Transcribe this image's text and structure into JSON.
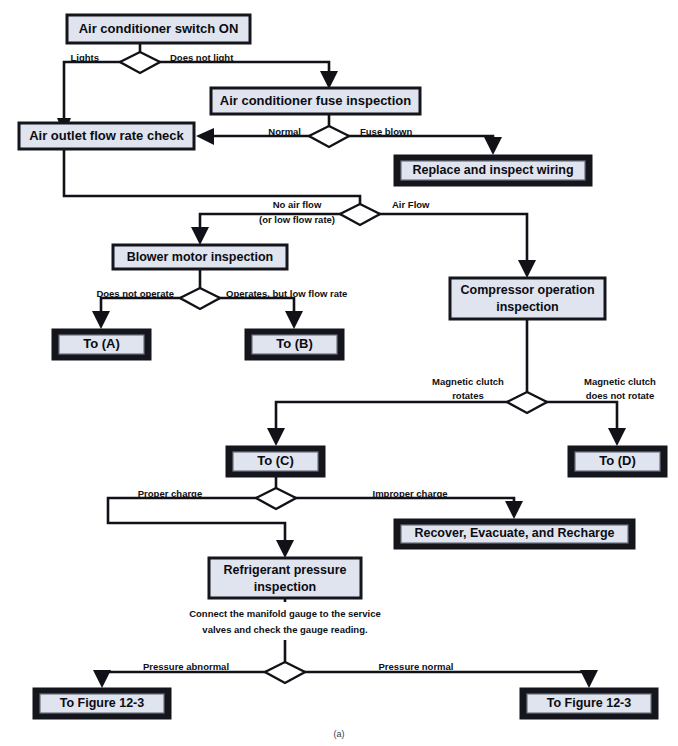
{
  "figure": {
    "caption": "(a)",
    "colors": {
      "box_fill": "#dfe4ef",
      "box_border": "#15151c",
      "line": "#111118",
      "text": "#0c0c12",
      "page_background": "#ffffff"
    }
  },
  "nodes": {
    "start": {
      "label": "Air conditioner switch ON",
      "style": "single"
    },
    "fuse_inspection": {
      "label": "Air conditioner fuse inspection",
      "style": "single"
    },
    "air_outlet_check": {
      "label": "Air outlet flow rate check",
      "style": "single"
    },
    "replace_wiring": {
      "label": "Replace and inspect wiring",
      "style": "double"
    },
    "blower_motor": {
      "label": "Blower motor inspection",
      "style": "single"
    },
    "to_a": {
      "label": "To (A)",
      "style": "double"
    },
    "to_b": {
      "label": "To (B)",
      "style": "double"
    },
    "compressor": {
      "label_line1": "Compressor operation",
      "label_line2": "inspection",
      "style": "single"
    },
    "to_c": {
      "label": "To (C)",
      "style": "double"
    },
    "to_d": {
      "label": "To (D)",
      "style": "double"
    },
    "recover": {
      "label": "Recover, Evacuate, and Recharge",
      "style": "double"
    },
    "refrigerant": {
      "label_line1": "Refrigerant pressure",
      "label_line2": "inspection",
      "style": "single"
    },
    "to_fig_left": {
      "label": "To Figure 12-3",
      "style": "double"
    },
    "to_fig_right": {
      "label": "To Figure 12-3",
      "style": "double"
    }
  },
  "decisions": {
    "switch_light": {
      "left_label": "Lights",
      "right_label": "Does not light"
    },
    "fuse_state": {
      "left_label": "Normal",
      "right_label": "Fuse blown"
    },
    "air_flow": {
      "left_label_line1": "No air flow",
      "left_label_line2": "(or low flow rate)",
      "right_label": "Air Flow"
    },
    "blower_state": {
      "left_label": "Does not operate",
      "right_label": "Operates, but low flow rate"
    },
    "clutch": {
      "left_label_line1": "Magnetic clutch",
      "left_label_line2": "rotates",
      "right_label_line1": "Magnetic clutch",
      "right_label_line2": "does not rotate"
    },
    "charge": {
      "left_label": "Proper charge",
      "right_label": "Improper charge"
    },
    "pressure": {
      "left_label": "Pressure abnormal",
      "right_label": "Pressure normal"
    }
  },
  "notes": {
    "manifold_gauge_line1": "Connect the manifold gauge to the service",
    "manifold_gauge_line2": "valves and check the gauge reading."
  }
}
